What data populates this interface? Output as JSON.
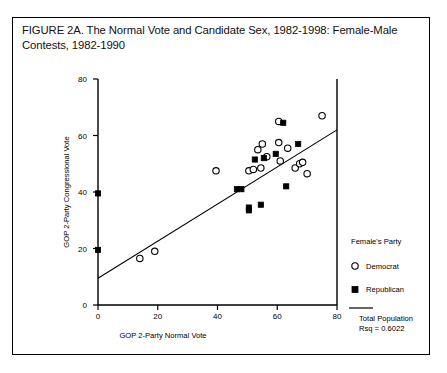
{
  "figure": {
    "title": "FIGURE 2A. The Normal Vote and Candidate Sex, 1982-1998: Female-Male Contests, 1982-1990"
  },
  "legend": {
    "heading": "Female's Party",
    "democrat_label": "Democrat",
    "republican_label": "Republican",
    "fit_label_line1": "Total Population",
    "fit_label_line2": "Rsq = 0.6022"
  },
  "axis_tick_labels": {
    "x": [
      "0",
      "20",
      "40",
      "60",
      "80"
    ],
    "y": [
      "0",
      "20",
      "40",
      "60",
      "80"
    ]
  },
  "chart_data": {
    "type": "scatter",
    "title": "FIGURE 2A. The Normal Vote and Candidate Sex, 1982-1998: Female-Male Contests, 1982-1990",
    "xlabel": "GOP 2-Party Normal Vote",
    "ylabel": "GOP 2-Party Congressional Vote",
    "xlim": [
      0,
      80
    ],
    "ylim": [
      0,
      80
    ],
    "xticks": [
      0,
      20,
      40,
      60,
      80
    ],
    "yticks": [
      0,
      20,
      40,
      60,
      80
    ],
    "grid": false,
    "legend_position": "right",
    "legend_title": "Female's Party",
    "annotations": [
      "Total Population",
      "Rsq = 0.6022"
    ],
    "rsq": 0.6022,
    "fit_line": {
      "label": "Total Population",
      "x": [
        0,
        80
      ],
      "y": [
        9.5,
        62.0
      ]
    },
    "series": [
      {
        "name": "Democrat",
        "marker": "open-circle",
        "points": [
          [
            14.0,
            16.5
          ],
          [
            19.0,
            19.0
          ],
          [
            39.5,
            47.5
          ],
          [
            50.5,
            47.5
          ],
          [
            52.0,
            48.0
          ],
          [
            53.5,
            55.0
          ],
          [
            55.0,
            57.0
          ],
          [
            54.5,
            48.5
          ],
          [
            56.5,
            52.5
          ],
          [
            60.5,
            57.5
          ],
          [
            60.5,
            65.0
          ],
          [
            61.0,
            51.0
          ],
          [
            63.5,
            55.5
          ],
          [
            66.0,
            48.5
          ],
          [
            67.5,
            50.0
          ],
          [
            68.5,
            50.5
          ],
          [
            70.0,
            46.5
          ],
          [
            75.0,
            67.0
          ]
        ]
      },
      {
        "name": "Republican",
        "marker": "filled-square",
        "points": [
          [
            0.0,
            19.5
          ],
          [
            0.0,
            39.5
          ],
          [
            46.5,
            41.0
          ],
          [
            48.0,
            41.0
          ],
          [
            50.5,
            33.5
          ],
          [
            50.5,
            34.5
          ],
          [
            52.5,
            51.5
          ],
          [
            54.5,
            35.5
          ],
          [
            55.5,
            52.0
          ],
          [
            59.5,
            53.5
          ],
          [
            62.0,
            64.5
          ],
          [
            63.0,
            42.0
          ],
          [
            67.0,
            57.0
          ]
        ]
      }
    ]
  }
}
